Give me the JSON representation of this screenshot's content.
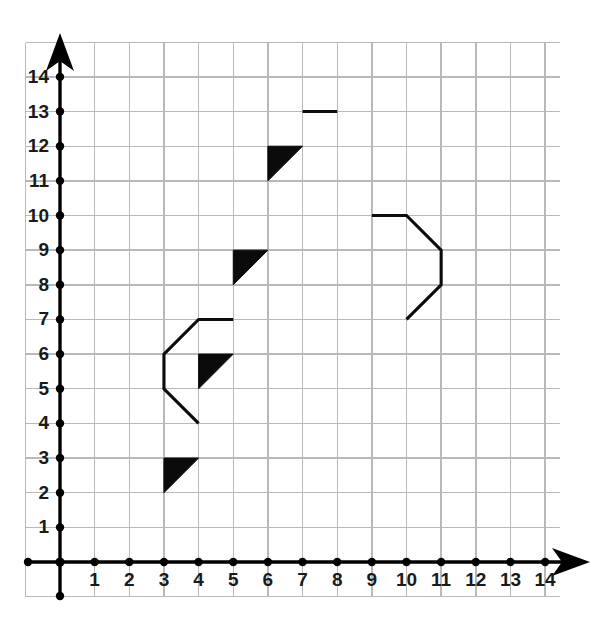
{
  "figure": {
    "title": "",
    "background_color": "#ffffff",
    "grid_color": "#b9b9b9",
    "axis_color": "#000000",
    "shape_color": "#0b0b0b"
  },
  "chart_data": {
    "type": "scatter",
    "title": "",
    "xlabel": "",
    "ylabel": "",
    "xlim": [
      0,
      14
    ],
    "ylim": [
      0,
      14
    ],
    "grid": true,
    "legend": "none",
    "axes": {
      "x_ticks": [
        1,
        2,
        3,
        4,
        5,
        6,
        7,
        8,
        9,
        10,
        11,
        12,
        13,
        14
      ],
      "y_ticks": [
        1,
        2,
        3,
        4,
        5,
        6,
        7,
        8,
        9,
        10,
        11,
        12,
        13,
        14
      ],
      "x_tick_labels": [
        "1",
        "2",
        "3",
        "4",
        "5",
        "6",
        "7",
        "8",
        "9",
        "10",
        "11",
        "12",
        "13",
        "14"
      ],
      "y_tick_labels": [
        "1",
        "2",
        "3",
        "4",
        "5",
        "6",
        "7",
        "8",
        "9",
        "10",
        "11",
        "12",
        "13",
        "14"
      ],
      "x_arrow": true,
      "y_arrow": true,
      "origin": [
        0,
        0
      ]
    },
    "shapes": [
      {
        "name": "filled-triangle-1",
        "kind": "polygon",
        "filled": true,
        "points": [
          [
            6,
            12
          ],
          [
            7,
            12
          ],
          [
            6,
            11
          ]
        ]
      },
      {
        "name": "filled-triangle-2",
        "kind": "polygon",
        "filled": true,
        "points": [
          [
            5,
            9
          ],
          [
            6,
            9
          ],
          [
            5,
            8
          ]
        ]
      },
      {
        "name": "filled-triangle-3",
        "kind": "polygon",
        "filled": true,
        "points": [
          [
            4,
            6
          ],
          [
            5,
            6
          ],
          [
            4,
            5
          ]
        ]
      },
      {
        "name": "filled-triangle-4",
        "kind": "polygon",
        "filled": true,
        "points": [
          [
            3,
            3
          ],
          [
            4,
            3
          ],
          [
            3,
            2
          ]
        ]
      },
      {
        "name": "left-open-polyline",
        "kind": "polyline",
        "filled": false,
        "points": [
          [
            5,
            7
          ],
          [
            4,
            7
          ],
          [
            3,
            6
          ],
          [
            3,
            5
          ],
          [
            4,
            4
          ]
        ]
      },
      {
        "name": "right-open-polyline",
        "kind": "polyline",
        "filled": false,
        "points": [
          [
            9,
            10
          ],
          [
            10,
            10
          ],
          [
            11,
            9
          ],
          [
            11,
            8
          ],
          [
            10,
            7
          ]
        ]
      },
      {
        "name": "top-segment",
        "kind": "polyline",
        "filled": false,
        "points": [
          [
            7,
            13
          ],
          [
            8,
            13
          ]
        ]
      }
    ]
  }
}
